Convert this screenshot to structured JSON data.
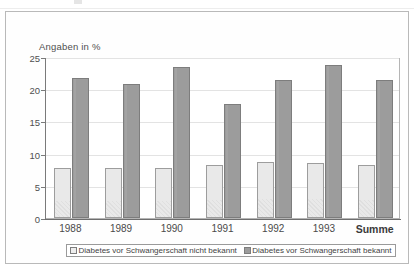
{
  "chart_data": {
    "type": "bar",
    "title": "",
    "axis_note": "Angaben in %",
    "xlabel": "",
    "ylabel": "",
    "ylim": [
      0,
      25
    ],
    "yticks": [
      0,
      5,
      10,
      15,
      20,
      25
    ],
    "grid": true,
    "legend_position": "bottom",
    "categories": [
      "1988",
      "1989",
      "1990",
      "1991",
      "1992",
      "1993",
      "Summe"
    ],
    "series": [
      {
        "name": "Diabetes vor Schwangerschaft nicht bekannt",
        "color": "#e9e9e9",
        "values": [
          7.7,
          7.7,
          7.7,
          8.2,
          8.7,
          8.5,
          8.2
        ]
      },
      {
        "name": "Diabetes vor Schwangerschaft bekannt",
        "color": "#9c9c9c",
        "values": [
          21.8,
          20.8,
          23.4,
          17.7,
          21.4,
          23.7,
          21.4
        ]
      }
    ]
  },
  "legend": {
    "entries": [
      {
        "label": "Diabetes vor Schwangerschaft nicht bekannt"
      },
      {
        "label": "Diabetes vor Schwangerschaft bekannt"
      }
    ]
  },
  "colors": {
    "series_light": "#e9e9e9",
    "series_dark": "#9c9c9c",
    "grid": "#e3e3e3",
    "axis": "#7a7a7a",
    "frame": "#b9b9b9",
    "text": "#4a4a4a"
  }
}
